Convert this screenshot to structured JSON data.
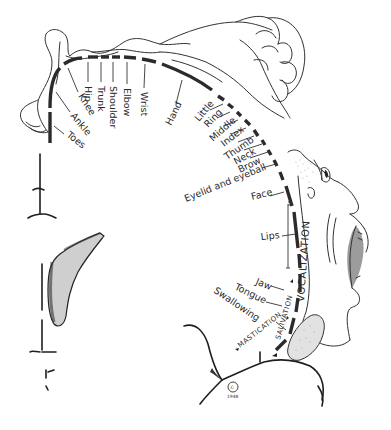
{
  "diagram": {
    "colors": {
      "ink": "#2b2b2b",
      "background": "#ffffff"
    },
    "labels": {
      "toes": "Toes",
      "ankle": "Ankle",
      "knee": "Knee",
      "hip": "Hip",
      "trunk": "Trunk",
      "shoulder": "Shoulder",
      "elbow": "Elbow",
      "wrist": "Wrist",
      "hand": "Hand",
      "little": "Little",
      "ring": "Ring",
      "middle": "Middle",
      "index": "Index",
      "thumb": "Thumb",
      "neck": "Neck",
      "brow": "Brow",
      "eyelid": "Eyelid and eyeball",
      "face": "Face",
      "lips": "Lips",
      "jaw": "Jaw",
      "tongue": "Tongue",
      "swallowing": "Swallowing",
      "vocalization": "VOCALIZATION",
      "salivation": "SALIVATION",
      "mastication": "MASTICATION"
    },
    "signature": {
      "mark": "C",
      "year": "1948"
    }
  }
}
